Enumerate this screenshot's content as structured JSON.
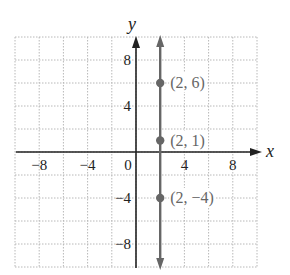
{
  "chart_data": {
    "type": "scatter",
    "title": "",
    "xlabel": "x",
    "ylabel": "y",
    "xlim": [
      -10,
      10
    ],
    "ylim": [
      -10,
      10
    ],
    "grid": true,
    "grid_step": 2,
    "x_ticks": [
      -8,
      -4,
      0,
      4,
      8
    ],
    "y_ticks": [
      8,
      4,
      -4,
      -8
    ],
    "x_tick_labels": [
      "−8",
      "−4",
      "0",
      "4",
      "8"
    ],
    "y_tick_labels": [
      "8",
      "4",
      "−4",
      "−8"
    ],
    "vertical_line": {
      "x": 2,
      "arrows": "both"
    },
    "points": [
      {
        "x": 2,
        "y": 6,
        "label": "(2, 6)"
      },
      {
        "x": 2,
        "y": 1,
        "label": "(2, 1)"
      },
      {
        "x": 2,
        "y": -4,
        "label": "(2, −4)"
      }
    ],
    "colors": {
      "line": "#666666",
      "point": "#666666",
      "axis": "#222222",
      "grid": "#b8b8b8"
    }
  }
}
